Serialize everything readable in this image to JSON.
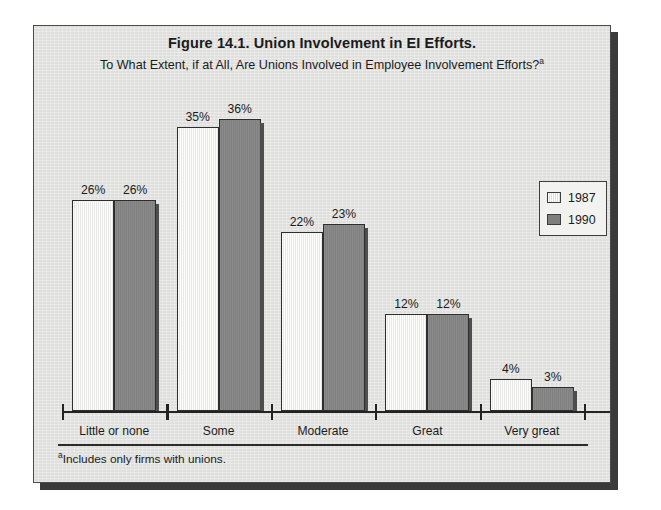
{
  "figure": {
    "title": "Figure 14.1. Union Involvement in EI Efforts.",
    "subtitle": "To What Extent, if at All, Are Unions Involved in Employee Involvement Efforts?",
    "subtitle_superscript": "a",
    "footnote_superscript": "a",
    "footnote": "Includes only firms with unions.",
    "background_color": "#e4e4e2",
    "frame_border_color": "#4a4a4a"
  },
  "legend": {
    "position": "top-right",
    "entries": [
      {
        "label": "1987",
        "swatch": "white-hatched",
        "color": "#f8f8f6"
      },
      {
        "label": "1990",
        "swatch": "solid-gray",
        "color": "#858585"
      }
    ]
  },
  "chart_data": {
    "type": "bar",
    "title": "Figure 14.1. Union Involvement in EI Efforts.",
    "subtitle": "To What Extent, if at All, Are Unions Involved in Employee Involvement Efforts?",
    "xlabel": "",
    "ylabel": "",
    "ylim": [
      0,
      40
    ],
    "grid": false,
    "legend_position": "top-right",
    "value_suffix": "%",
    "categories": [
      "Little or none",
      "Some",
      "Moderate",
      "Great",
      "Very great"
    ],
    "series": [
      {
        "name": "1987",
        "color": "#f8f8f6",
        "values": [
          26,
          35,
          22,
          12,
          4
        ],
        "labels": [
          "26%",
          "35%",
          "22%",
          "12%",
          "4%"
        ]
      },
      {
        "name": "1990",
        "color": "#858585",
        "values": [
          26,
          36,
          23,
          12,
          3
        ],
        "labels": [
          "26%",
          "36%",
          "23%",
          "12%",
          "3%"
        ]
      }
    ]
  }
}
